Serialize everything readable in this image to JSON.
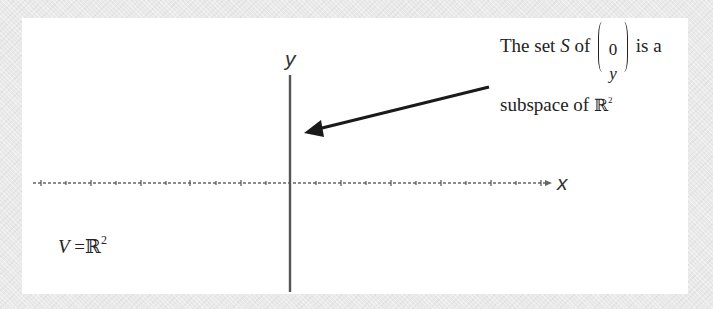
{
  "diagram": {
    "axes": {
      "x_label": "x",
      "y_label": "y",
      "x_tick_count": 20,
      "colors": {
        "axis": "#555555",
        "arrow": "#1a1a1a",
        "background": "#ffffff",
        "frame": "#e9e9e9"
      }
    },
    "annotation": {
      "line1_prefix": "The set ",
      "set_symbol": "S",
      "line1_of": " of",
      "vector_top": "0",
      "vector_bottom": "y",
      "line1_suffix": "is a",
      "line2_text": "subspace of ",
      "line2_field": "ℝ",
      "line2_exp": "2"
    },
    "space_label": {
      "var": "V",
      "equals": " =",
      "field": "ℝ",
      "exp": "2"
    }
  }
}
